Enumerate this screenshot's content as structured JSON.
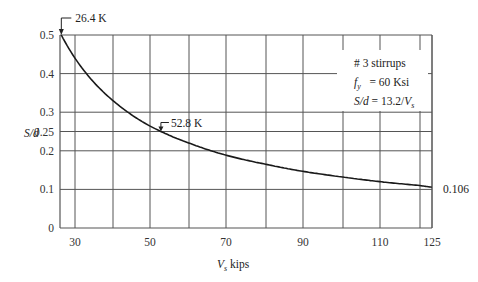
{
  "chart_data": {
    "type": "line",
    "title": "",
    "xlabel": "V_s kips",
    "ylabel": "S/d",
    "xlim": [
      25,
      125
    ],
    "ylim": [
      0,
      0.5
    ],
    "x_ticks": [
      30,
      50,
      70,
      90,
      110,
      125
    ],
    "x_gridlines": [
      30,
      40,
      50,
      60,
      70,
      80,
      90,
      100,
      110,
      120,
      125
    ],
    "y_ticks": [
      0,
      0.1,
      0.2,
      0.25,
      0.3,
      0.4,
      0.5
    ],
    "grid": true,
    "series": [
      {
        "name": "S/d = 13.2/V_s",
        "formula": "S/d = 13.2 / V_s",
        "x": [
          26.4,
          30,
          35,
          40,
          45,
          50,
          52.8,
          55,
          60,
          65,
          70,
          80,
          90,
          100,
          110,
          120,
          125
        ],
        "y": [
          0.5,
          0.44,
          0.377,
          0.33,
          0.293,
          0.264,
          0.25,
          0.24,
          0.22,
          0.203,
          0.189,
          0.165,
          0.147,
          0.132,
          0.12,
          0.11,
          0.106
        ]
      }
    ],
    "annotations": [
      {
        "text": "26.4 K",
        "x": 26.4,
        "y": 0.5
      },
      {
        "text": "52.8 K",
        "x": 52.8,
        "y": 0.25
      },
      {
        "text": "0.106",
        "x": 125,
        "y": 0.106
      }
    ],
    "legend": {
      "position": "upper right",
      "lines": [
        "# 3 stirrups",
        "f_y = 60 Ksi",
        "S/d = 13.2/V_s"
      ]
    }
  },
  "labels": {
    "y_axis_name": "S/d",
    "x_axis_main": "V",
    "x_axis_sub": "s",
    "x_axis_unit": " kips",
    "ann_start": "26.4 K",
    "ann_mid": "52.8 K",
    "ann_end": "0.106",
    "legend_line1": "# 3 stirrups",
    "legend_fy_main": "f",
    "legend_fy_sub": "y",
    "legend_fy_rest": "   = 60 Ksi",
    "legend_sd_main": "S/d",
    "legend_sd_rest": " = 13.2/",
    "legend_sd_v": "V",
    "legend_sd_sub": "s"
  },
  "colors": {
    "grid": "#555555",
    "curve": "#1a1a1a",
    "text": "#222222"
  }
}
